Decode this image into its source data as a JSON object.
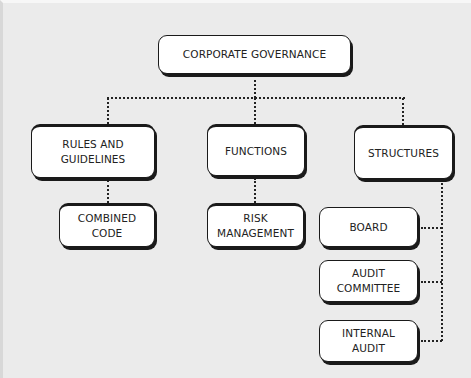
{
  "diagram": {
    "type": "org-chart",
    "root": {
      "label": "CORPORATE GOVERNANCE"
    },
    "categories": [
      {
        "label": "RULES AND\nGUIDELINES",
        "children": [
          {
            "label": "COMBINED\nCODE"
          }
        ]
      },
      {
        "label": "FUNCTIONS",
        "children": [
          {
            "label": "RISK\nMANAGEMENT"
          }
        ]
      },
      {
        "label": "STRUCTURES",
        "children": [
          {
            "label": "BOARD"
          },
          {
            "label": "AUDIT\nCOMMITTEE"
          },
          {
            "label": "INTERNAL\nAUDIT"
          }
        ]
      }
    ],
    "connector_style": "dotted",
    "colors": {
      "background": "#ebebeb",
      "box_fill": "#ffffff",
      "box_border": "#1a1a1a",
      "text": "#222222",
      "connector": "#222222"
    }
  }
}
